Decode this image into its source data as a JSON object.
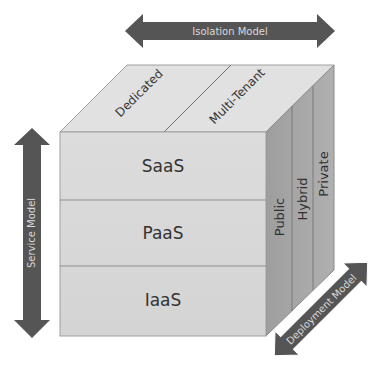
{
  "diagram": {
    "colors": {
      "front_face": "#d9d9d9",
      "top_face": "#e1e1e1",
      "right_face": "#a9a9a9",
      "edge": "#9a9a9a",
      "divider": "#7f7f7f",
      "arrow": "#555555",
      "arrow_text": "#d9d9d9",
      "face_text": "#333333"
    },
    "axes": {
      "isolation": {
        "label": "Isolation Model"
      },
      "service": {
        "label": "Service Model"
      },
      "deployment": {
        "label": "Deployment Model"
      }
    },
    "isolation_models": [
      {
        "label": "Dedicated"
      },
      {
        "label": "Multi-Tenant"
      }
    ],
    "service_models": [
      {
        "label": "SaaS"
      },
      {
        "label": "PaaS"
      },
      {
        "label": "IaaS"
      }
    ],
    "deployment_models": [
      {
        "label": "Public"
      },
      {
        "label": "Hybrid"
      },
      {
        "label": "Private"
      }
    ]
  }
}
